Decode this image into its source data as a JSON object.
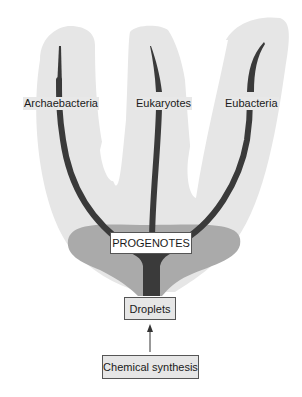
{
  "diagram": {
    "title": "",
    "branches": [
      {
        "label": "Archaebacteria"
      },
      {
        "label": "Eukaryotes"
      },
      {
        "label": "Eubacteria"
      }
    ],
    "root_node": {
      "label": "PROGENOTES"
    },
    "precursor_node": {
      "label": "Droplets"
    },
    "origin_node": {
      "label": "Chemical synthesis"
    },
    "edges": [
      {
        "from": "Chemical synthesis",
        "to": "Droplets",
        "type": "arrow"
      },
      {
        "from": "Droplets",
        "to": "PROGENOTES",
        "type": "trunk"
      },
      {
        "from": "PROGENOTES",
        "to": "Archaebacteria",
        "type": "branch"
      },
      {
        "from": "PROGENOTES",
        "to": "Eukaryotes",
        "type": "branch"
      },
      {
        "from": "PROGENOTES",
        "to": "Eubacteria",
        "type": "branch"
      }
    ],
    "colors": {
      "lobe_fill": "#e6e6e6",
      "progenote_zone": "#aaaaaa",
      "branch": "#3a3a3a",
      "box_border": "#555555"
    }
  }
}
